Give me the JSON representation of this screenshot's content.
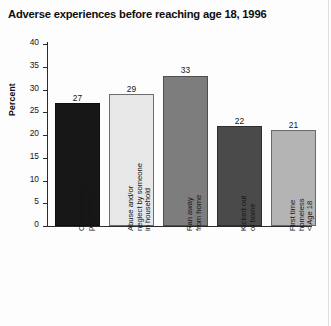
{
  "chart_data": {
    "type": "bar",
    "title": "Adverse experiences before reaching age 18, 1996",
    "xlabel": "",
    "ylabel": "Percent",
    "ylim": [
      0,
      40
    ],
    "yticks": [
      0,
      5,
      10,
      15,
      20,
      25,
      30,
      35,
      40
    ],
    "ytick_labels": [
      "0",
      "5",
      "10",
      "15",
      "20",
      "25",
      "30",
      "35",
      "40"
    ],
    "grid": false,
    "legend": null,
    "categories": [
      "Out-of-Home placement",
      "Abuse and/or neglect by someone in household",
      "Ran away from home",
      "Kicked out of home",
      "First time homeless < Age 18"
    ],
    "category_label_lines": [
      [
        "Out-of-Home",
        "placement"
      ],
      [
        "Abuse and/or",
        "neglect by someone",
        "in household"
      ],
      [
        "Ran away",
        "from home"
      ],
      [
        "Kicked out",
        "of home"
      ],
      [
        "First time",
        "homeless",
        "< Age 18"
      ]
    ],
    "values": [
      27,
      29,
      33,
      22,
      21
    ],
    "value_labels": [
      "27",
      "29",
      "33",
      "22",
      "21"
    ],
    "bar_colors": [
      "#171717",
      "#e7e7e7",
      "#7d7d7d",
      "#4a4a4a",
      "#b4b4b4"
    ],
    "bar_edge_colors": [
      "#0d0d0d",
      "#6d6d6d",
      "#4f4f4f",
      "#2e2e2e",
      "#6a6a6a"
    ]
  }
}
